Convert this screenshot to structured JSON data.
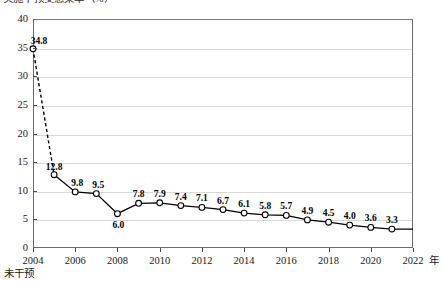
{
  "chart_data": {
    "type": "line",
    "title": "实施干预受感染率（%）",
    "title_clipped": true,
    "xlabel": "",
    "ylabel": "",
    "x_unit_label": "年",
    "baseline_annotation": "未干预",
    "grid": true,
    "legend_position": "none",
    "xlim": [
      2004,
      2022
    ],
    "ylim": [
      0,
      40
    ],
    "y_ticks": [
      0,
      5,
      10,
      15,
      20,
      25,
      30,
      35,
      40
    ],
    "x_ticks": [
      2004,
      2006,
      2008,
      2010,
      2012,
      2014,
      2016,
      2018,
      2020,
      2022
    ],
    "x": [
      2004,
      2005,
      2006,
      2007,
      2008,
      2009,
      2010,
      2011,
      2012,
      2013,
      2014,
      2015,
      2016,
      2017,
      2018,
      2019,
      2020,
      2021,
      2022
    ],
    "values": [
      34.8,
      12.8,
      9.8,
      9.5,
      6.0,
      7.8,
      7.9,
      7.4,
      7.1,
      6.7,
      6.1,
      5.8,
      5.7,
      4.9,
      4.5,
      4.0,
      3.6,
      3.3,
      3.3
    ],
    "point_labels": [
      "34.8",
      "12.8",
      "9.8",
      "9.5",
      "6.0",
      "7.8",
      "7.9",
      "7.4",
      "7.1",
      "6.7",
      "6.1",
      "5.8",
      "5.7",
      "4.9",
      "4.5",
      "4.0",
      "3.6",
      "3.3",
      ""
    ],
    "series": [
      {
        "name": "受感染率",
        "values": [
          34.8,
          12.8,
          9.8,
          9.5,
          6.0,
          7.8,
          7.9,
          7.4,
          7.1,
          6.7,
          6.1,
          5.8,
          5.7,
          4.9,
          4.5,
          4.0,
          3.6,
          3.3,
          3.3
        ],
        "marker": "open-circle",
        "line_color": "#000000",
        "marker_fill": "#ffffff",
        "first_segment_style": "dashed"
      }
    ],
    "colors": {
      "line": "#000000",
      "marker_fill": "#ffffff",
      "grid": "#d9d9d9",
      "frame": "#6b6b6b",
      "text": "#1a1a1a"
    }
  }
}
